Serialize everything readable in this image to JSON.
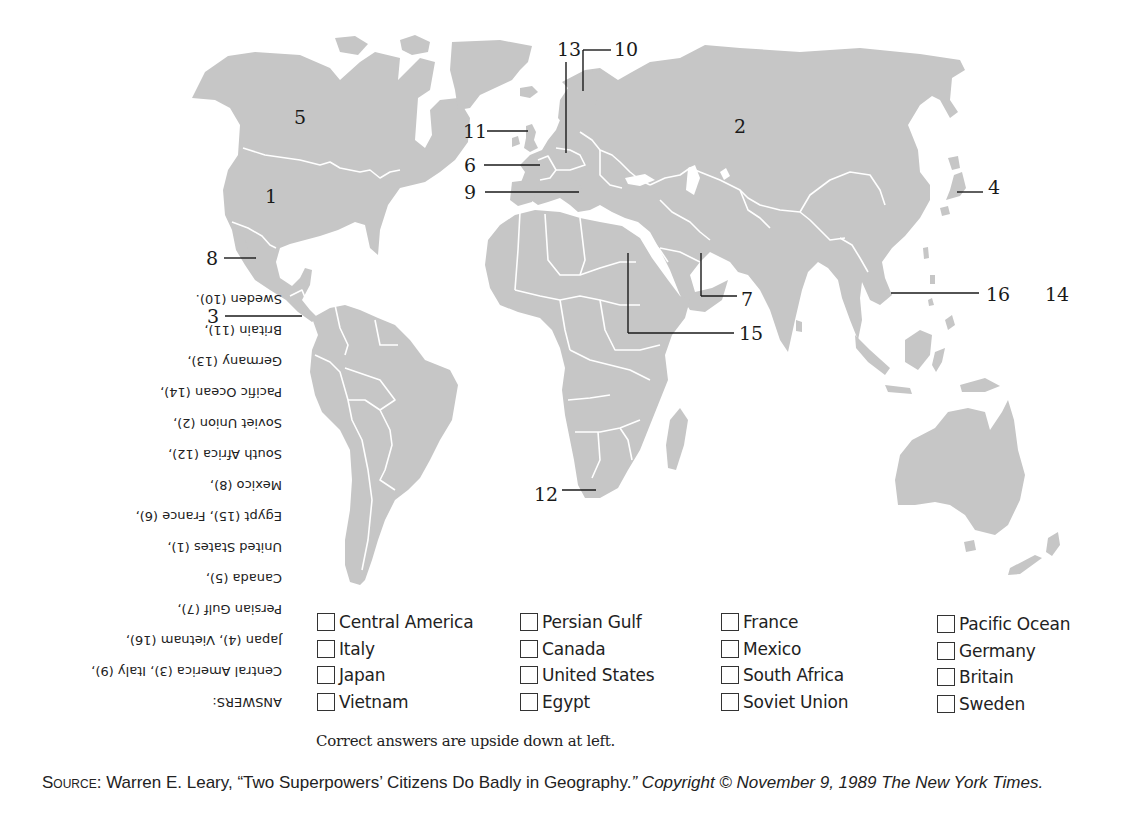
{
  "map": {
    "title": "World map quiz",
    "colors": {
      "land": "#c6c6c6",
      "borders": "#ffffff",
      "ink": "#1a1a1a"
    },
    "labels": [
      {
        "id": "1",
        "text": "1",
        "region": "United States"
      },
      {
        "id": "2",
        "text": "2",
        "region": "Soviet Union"
      },
      {
        "id": "3",
        "text": "3",
        "region": "Central America"
      },
      {
        "id": "4",
        "text": "4",
        "region": "Japan"
      },
      {
        "id": "5",
        "text": "5",
        "region": "Canada"
      },
      {
        "id": "6",
        "text": "6",
        "region": "France"
      },
      {
        "id": "7",
        "text": "7",
        "region": "Persian Gulf"
      },
      {
        "id": "8",
        "text": "8",
        "region": "Mexico"
      },
      {
        "id": "9",
        "text": "9",
        "region": "Italy"
      },
      {
        "id": "10",
        "text": "10",
        "region": "Sweden"
      },
      {
        "id": "11",
        "text": "11",
        "region": "Britain"
      },
      {
        "id": "12",
        "text": "12",
        "region": "South Africa"
      },
      {
        "id": "13",
        "text": "13",
        "region": "Germany"
      },
      {
        "id": "14",
        "text": "14",
        "region": "Pacific Ocean"
      },
      {
        "id": "15",
        "text": "15",
        "region": "Egypt"
      },
      {
        "id": "16",
        "text": "16",
        "region": "Vietnam"
      }
    ]
  },
  "answers": {
    "heading": "ANSWERS:",
    "lines": [
      "Central America (3), Italy (9),",
      "Japan (4), Vietnam (16),",
      "Persian Gulf (7),",
      "Canada (5),",
      "United States (1),",
      "Egypt (15), France (6),",
      "Mexico (8),",
      "South Africa (12),",
      "Soviet Union (2),",
      "Pacific Ocean (14),",
      "Germany (13),",
      "Britain (11),",
      "Sweden (10)."
    ],
    "orientation": "upside down"
  },
  "choices": {
    "columns": [
      [
        "Central America",
        "Italy",
        "Japan",
        "Vietnam"
      ],
      [
        "Persian Gulf",
        "Canada",
        "United States",
        "Egypt"
      ],
      [
        "France",
        "Mexico",
        "South Africa",
        "Soviet Union"
      ],
      [
        "Pacific Ocean",
        "Germany",
        "Britain",
        "Sweden"
      ]
    ]
  },
  "note": "Correct answers are upside down at left.",
  "source": {
    "label": "Source:",
    "text": " Warren E. Leary, “Two Superpowers’ Citizens Do Badly in Geography.",
    "italic": "” Copyright © November 9, 1989 The New York Times."
  }
}
